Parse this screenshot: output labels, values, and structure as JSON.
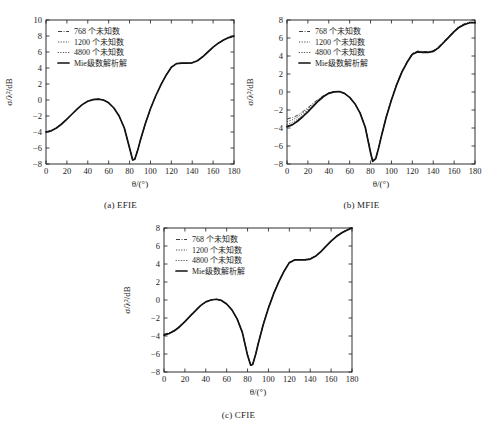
{
  "figure": {
    "background": "#ffffff",
    "ink": "#1a1a1a"
  },
  "panels": [
    {
      "id": "a",
      "caption": "(a) EFIE"
    },
    {
      "id": "b",
      "caption": "(b) MFIE"
    },
    {
      "id": "c",
      "caption": "(c) CFIE"
    }
  ],
  "legend_series": [
    {
      "label": "768 个未知数",
      "style": "dashdot"
    },
    {
      "label": "1200 个未知数",
      "style": "dotted"
    },
    {
      "label": "4800 个未知数",
      "style": "dots"
    },
    {
      "label": "Mie级数解析解",
      "style": "solid"
    }
  ],
  "axes": {
    "xlabel": "θ/(°)",
    "ylabel": "σ/λ²/dB",
    "xticks": [
      0,
      20,
      40,
      60,
      80,
      100,
      120,
      140,
      160,
      180
    ],
    "yticks_a": [
      -8,
      -6,
      -4,
      -2,
      0,
      2,
      4,
      6,
      8,
      10
    ],
    "yticks_b": [
      -8,
      -6,
      -4,
      -2,
      0,
      2,
      4,
      6,
      8
    ],
    "yticks_c": [
      -8,
      -6,
      -4,
      -2,
      0,
      2,
      4,
      6,
      8
    ]
  },
  "chart_data": [
    {
      "type": "line",
      "title": "(a) EFIE",
      "xlabel": "θ/(°)",
      "ylabel": "σ/λ²/dB",
      "xlim": [
        0,
        180
      ],
      "ylim": [
        -8,
        10
      ],
      "grid": false,
      "legend_position": "upper-left",
      "x": [
        0,
        5,
        10,
        15,
        20,
        25,
        30,
        35,
        40,
        45,
        50,
        55,
        60,
        65,
        70,
        75,
        80,
        83,
        85,
        88,
        90,
        95,
        100,
        105,
        110,
        115,
        120,
        125,
        130,
        135,
        140,
        145,
        150,
        155,
        160,
        165,
        170,
        175,
        180
      ],
      "series": [
        {
          "name": "768 个未知数",
          "style": "dashdot",
          "values": [
            -4.0,
            -3.85,
            -3.5,
            -3.0,
            -2.4,
            -1.75,
            -1.1,
            -0.55,
            -0.15,
            0.05,
            0.12,
            0.0,
            -0.35,
            -1.0,
            -2.0,
            -3.5,
            -6.0,
            -7.5,
            -7.4,
            -6.2,
            -5.2,
            -3.0,
            -1.1,
            0.5,
            1.9,
            3.1,
            4.1,
            4.55,
            4.6,
            4.6,
            4.65,
            4.9,
            5.4,
            6.0,
            6.6,
            7.1,
            7.5,
            7.8,
            8.0
          ]
        },
        {
          "name": "1200 个未知数",
          "style": "dotted",
          "values": [
            -4.0,
            -3.85,
            -3.5,
            -3.0,
            -2.4,
            -1.75,
            -1.1,
            -0.55,
            -0.15,
            0.05,
            0.12,
            0.0,
            -0.35,
            -1.0,
            -2.0,
            -3.5,
            -6.0,
            -7.5,
            -7.4,
            -6.2,
            -5.2,
            -3.0,
            -1.1,
            0.5,
            1.9,
            3.1,
            4.1,
            4.55,
            4.6,
            4.6,
            4.65,
            4.9,
            5.4,
            6.0,
            6.6,
            7.1,
            7.5,
            7.8,
            8.0
          ]
        },
        {
          "name": "4800 个未知数",
          "style": "dots",
          "values": [
            -4.0,
            -3.85,
            -3.5,
            -3.0,
            -2.4,
            -1.75,
            -1.1,
            -0.55,
            -0.15,
            0.05,
            0.12,
            0.0,
            -0.35,
            -1.0,
            -2.0,
            -3.5,
            -6.0,
            -7.5,
            -7.4,
            -6.2,
            -5.2,
            -3.0,
            -1.1,
            0.5,
            1.9,
            3.1,
            4.1,
            4.55,
            4.6,
            4.6,
            4.65,
            4.9,
            5.4,
            6.0,
            6.6,
            7.1,
            7.5,
            7.8,
            8.0
          ]
        },
        {
          "name": "Mie级数解析解",
          "style": "solid",
          "values": [
            -4.0,
            -3.85,
            -3.5,
            -3.0,
            -2.4,
            -1.75,
            -1.1,
            -0.55,
            -0.15,
            0.05,
            0.12,
            0.0,
            -0.35,
            -1.0,
            -2.0,
            -3.5,
            -6.0,
            -7.5,
            -7.4,
            -6.2,
            -5.2,
            -3.0,
            -1.1,
            0.5,
            1.9,
            3.1,
            4.1,
            4.55,
            4.6,
            4.6,
            4.65,
            4.9,
            5.4,
            6.0,
            6.6,
            7.1,
            7.5,
            7.8,
            8.0
          ]
        }
      ]
    },
    {
      "type": "line",
      "title": "(b) MFIE",
      "xlabel": "θ/(°)",
      "ylabel": "σ/λ²/dB",
      "xlim": [
        0,
        180
      ],
      "ylim": [
        -8,
        8
      ],
      "grid": false,
      "legend_position": "upper-left",
      "x": [
        0,
        5,
        10,
        15,
        20,
        25,
        30,
        35,
        40,
        45,
        50,
        55,
        60,
        65,
        70,
        75,
        80,
        82,
        85,
        88,
        90,
        95,
        100,
        105,
        110,
        115,
        120,
        125,
        130,
        135,
        140,
        145,
        150,
        155,
        160,
        165,
        170,
        175,
        180
      ],
      "series": [
        {
          "name": "768 个未知数",
          "style": "dashdot",
          "values": [
            -3.0,
            -2.85,
            -2.6,
            -2.2,
            -1.75,
            -1.25,
            -0.8,
            -0.4,
            -0.1,
            0.05,
            0.05,
            -0.15,
            -0.6,
            -1.3,
            -2.3,
            -3.9,
            -6.6,
            -7.6,
            -7.3,
            -6.0,
            -5.0,
            -2.7,
            -0.8,
            0.9,
            2.3,
            3.4,
            4.3,
            4.55,
            4.5,
            4.5,
            4.6,
            5.0,
            5.6,
            6.2,
            6.8,
            7.3,
            7.6,
            7.75,
            7.7
          ]
        },
        {
          "name": "1200 个未知数",
          "style": "dotted",
          "values": [
            -3.3,
            -3.1,
            -2.8,
            -2.4,
            -1.9,
            -1.4,
            -0.9,
            -0.45,
            -0.12,
            0.04,
            0.05,
            -0.15,
            -0.6,
            -1.3,
            -2.35,
            -3.95,
            -6.7,
            -7.65,
            -7.35,
            -6.05,
            -5.05,
            -2.75,
            -0.85,
            0.85,
            2.25,
            3.35,
            4.25,
            4.5,
            4.45,
            4.45,
            4.55,
            4.95,
            5.55,
            6.15,
            6.75,
            7.25,
            7.55,
            7.7,
            7.7
          ]
        },
        {
          "name": "4800 个未知数",
          "style": "dots",
          "values": [
            -3.6,
            -3.4,
            -3.05,
            -2.6,
            -2.05,
            -1.5,
            -0.95,
            -0.5,
            -0.15,
            0.03,
            0.05,
            -0.15,
            -0.6,
            -1.3,
            -2.35,
            -3.95,
            -6.75,
            -7.7,
            -7.4,
            -6.1,
            -5.1,
            -2.8,
            -0.9,
            0.8,
            2.2,
            3.3,
            4.2,
            4.45,
            4.4,
            4.4,
            4.5,
            4.9,
            5.5,
            6.1,
            6.7,
            7.2,
            7.5,
            7.7,
            7.7
          ]
        },
        {
          "name": "Mie级数解析解",
          "style": "solid",
          "values": [
            -3.85,
            -3.65,
            -3.25,
            -2.75,
            -2.2,
            -1.6,
            -1.0,
            -0.5,
            -0.15,
            0.02,
            0.05,
            -0.15,
            -0.6,
            -1.3,
            -2.35,
            -3.95,
            -6.75,
            -7.7,
            -7.4,
            -6.1,
            -5.1,
            -2.8,
            -0.9,
            0.8,
            2.2,
            3.3,
            4.2,
            4.45,
            4.4,
            4.4,
            4.5,
            4.9,
            5.5,
            6.1,
            6.7,
            7.2,
            7.5,
            7.7,
            7.7
          ]
        }
      ]
    },
    {
      "type": "line",
      "title": "(c) CFIE",
      "xlabel": "θ/(°)",
      "ylabel": "σ/λ²/dB",
      "xlim": [
        0,
        180
      ],
      "ylim": [
        -8,
        8
      ],
      "grid": false,
      "legend_position": "upper-left",
      "x": [
        0,
        5,
        10,
        15,
        20,
        25,
        30,
        35,
        40,
        45,
        50,
        55,
        60,
        65,
        70,
        75,
        80,
        83,
        85,
        88,
        90,
        95,
        100,
        105,
        110,
        115,
        120,
        125,
        130,
        135,
        140,
        145,
        150,
        155,
        160,
        165,
        170,
        175,
        180
      ],
      "series": [
        {
          "name": "768 个未知数",
          "style": "dashdot",
          "values": [
            -3.8,
            -3.65,
            -3.35,
            -2.9,
            -2.35,
            -1.75,
            -1.15,
            -0.6,
            -0.2,
            0.0,
            0.08,
            -0.05,
            -0.45,
            -1.1,
            -2.1,
            -3.6,
            -6.1,
            -7.2,
            -7.1,
            -5.9,
            -4.9,
            -2.7,
            -0.85,
            0.75,
            2.1,
            3.25,
            4.2,
            4.5,
            4.5,
            4.5,
            4.6,
            4.9,
            5.4,
            6.0,
            6.6,
            7.1,
            7.5,
            7.8,
            8.0
          ]
        },
        {
          "name": "1200 个未知数",
          "style": "dotted",
          "values": [
            -3.85,
            -3.7,
            -3.4,
            -2.95,
            -2.38,
            -1.78,
            -1.18,
            -0.62,
            -0.2,
            0.0,
            0.08,
            -0.05,
            -0.45,
            -1.1,
            -2.1,
            -3.6,
            -6.12,
            -7.22,
            -7.12,
            -5.92,
            -4.92,
            -2.72,
            -0.88,
            0.72,
            2.08,
            3.22,
            4.18,
            4.48,
            4.48,
            4.48,
            4.58,
            4.88,
            5.38,
            5.98,
            6.58,
            7.08,
            7.48,
            7.78,
            8.0
          ]
        },
        {
          "name": "4800 个未知数",
          "style": "dots",
          "values": [
            -3.9,
            -3.72,
            -3.42,
            -2.97,
            -2.4,
            -1.8,
            -1.2,
            -0.63,
            -0.21,
            0.0,
            0.08,
            -0.05,
            -0.45,
            -1.1,
            -2.1,
            -3.6,
            -6.15,
            -7.25,
            -7.15,
            -5.95,
            -4.95,
            -2.75,
            -0.9,
            0.7,
            2.05,
            3.2,
            4.15,
            4.45,
            4.45,
            4.45,
            4.55,
            4.85,
            5.35,
            5.95,
            6.55,
            7.05,
            7.45,
            7.75,
            8.0
          ]
        },
        {
          "name": "Mie级数解析解",
          "style": "solid",
          "values": [
            -3.9,
            -3.72,
            -3.42,
            -2.97,
            -2.4,
            -1.8,
            -1.2,
            -0.63,
            -0.21,
            0.0,
            0.08,
            -0.05,
            -0.45,
            -1.1,
            -2.1,
            -3.6,
            -6.15,
            -7.25,
            -7.15,
            -5.95,
            -4.95,
            -2.75,
            -0.9,
            0.7,
            2.05,
            3.2,
            4.15,
            4.45,
            4.45,
            4.45,
            4.55,
            4.85,
            5.35,
            5.95,
            6.55,
            7.05,
            7.45,
            7.75,
            8.0
          ]
        }
      ]
    }
  ]
}
